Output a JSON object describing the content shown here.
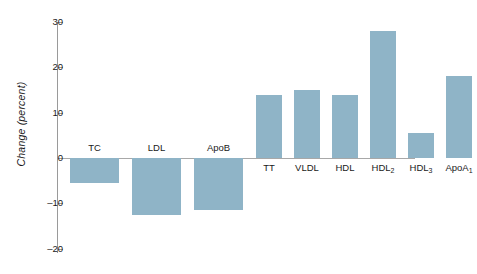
{
  "chart_data": {
    "type": "bar",
    "title": "",
    "xlabel": "",
    "ylabel": "Change (percent)",
    "ylim": [
      -20,
      30
    ],
    "yticks": [
      30,
      20,
      10,
      0,
      -10,
      -20
    ],
    "ytick_labels": [
      "30",
      "20",
      "10",
      "0",
      "–10",
      "–20"
    ],
    "grid": false,
    "legend": "none",
    "bar_color": "#8fb4c7",
    "axis_color": "#9a9a9a",
    "categories": [
      "TC",
      "LDL",
      "ApoB",
      "TT",
      "VLDL",
      "HDL",
      "HDL2",
      "HDL3",
      "ApoA1"
    ],
    "category_labels": [
      "TC",
      "LDL",
      "ApoB",
      "TT",
      "VLDL",
      "HDL",
      "HDL",
      "HDL",
      "ApoA"
    ],
    "category_subscripts": [
      "",
      "",
      "",
      "",
      "",
      "",
      "2",
      "3",
      "1"
    ],
    "values": [
      -5.5,
      -12.5,
      -11.5,
      14,
      15,
      14,
      28,
      5.5,
      18
    ],
    "series": [
      {
        "name": "Change (percent)",
        "values": [
          -5.5,
          -12.5,
          -11.5,
          14,
          15,
          14,
          28,
          5.5,
          18
        ]
      }
    ]
  },
  "layout": {
    "bars": [
      {
        "x": 12,
        "w": 49,
        "label_below": false
      },
      {
        "x": 74,
        "w": 49,
        "label_below": false
      },
      {
        "x": 136,
        "w": 49,
        "label_below": false
      },
      {
        "x": 198,
        "w": 26,
        "label_below": true
      },
      {
        "x": 236,
        "w": 26,
        "label_below": true
      },
      {
        "x": 274,
        "w": 26,
        "label_below": true
      },
      {
        "x": 312,
        "w": 26,
        "label_below": true
      },
      {
        "x": 350,
        "w": 26,
        "label_below": true
      },
      {
        "x": 388,
        "w": 26,
        "label_below": true
      }
    ]
  }
}
